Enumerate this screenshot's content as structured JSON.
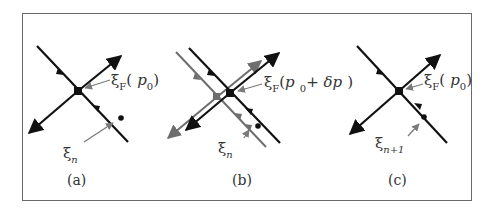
{
  "figure": {
    "frame_color": "#6a6a6a",
    "manifold_color": "#111111",
    "shifted_manifold_color": "#6e6e6e",
    "pointer_color": "#7a7a7a",
    "panels": [
      {
        "id": "a",
        "caption": "(a)",
        "fixed_point_label": {
          "symbol": "ξ",
          "sub": "F",
          "open": "(",
          "arg": "p",
          "arg_sub": "0",
          "extra": "",
          "close": ")"
        },
        "iterate_label": {
          "symbol": "ξ",
          "sub": "n"
        }
      },
      {
        "id": "b",
        "caption": "(b)",
        "fixed_point_label": {
          "symbol": "ξ",
          "sub": "F",
          "open": "(",
          "arg": "p",
          "arg_sub": "0",
          "extra": "+ δp",
          "close": ")"
        },
        "iterate_label": {
          "symbol": "ξ",
          "sub": "n"
        }
      },
      {
        "id": "c",
        "caption": "(c)",
        "fixed_point_label": {
          "symbol": "ξ",
          "sub": "F",
          "open": "(",
          "arg": "p",
          "arg_sub": "0",
          "extra": "",
          "close": ")"
        },
        "iterate_label": {
          "symbol": "ξ",
          "sub": "n+1"
        }
      }
    ]
  }
}
